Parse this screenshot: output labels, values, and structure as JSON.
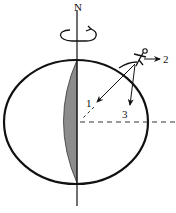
{
  "diagram": {
    "axis_label": "N",
    "vector_labels": {
      "v1": "1",
      "v2": "2",
      "v3": "3"
    },
    "elements": {
      "earth": "ellipse",
      "rotation_axis": "vertical line through poles",
      "rotation_indicator": "curved-arrow-icon",
      "shaded_region": "meridian lens segment",
      "observer": "person-icon",
      "equator_reference": "dashed horizontal line"
    },
    "colors": {
      "stroke": "#111111",
      "shade": "#8c8c8c",
      "background": "#ffffff"
    }
  }
}
